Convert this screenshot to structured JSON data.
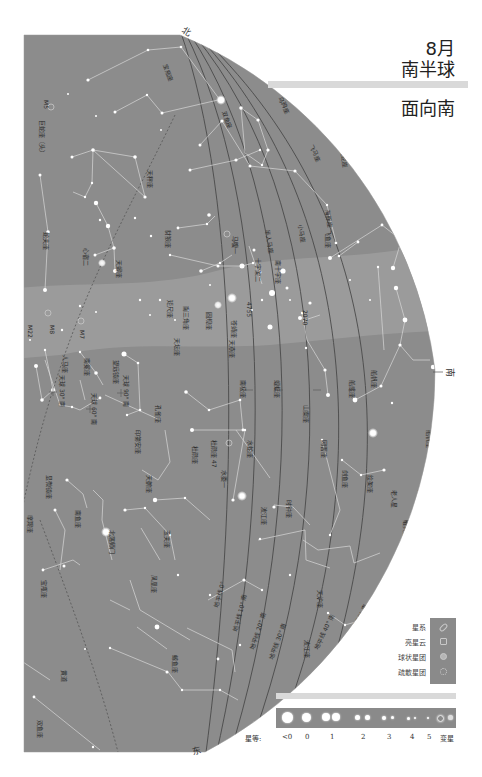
{
  "header": {
    "month": "8月",
    "hemisphere": "南半球",
    "facing": "面向南"
  },
  "directions": {
    "north": "北",
    "south": "南",
    "east": "东"
  },
  "horizon_lines": [
    {
      "label": "地平线 0°"
    },
    {
      "label": "地平线 10° 南"
    },
    {
      "label": "地平线 20° 南"
    },
    {
      "label": "地平线 30° 南"
    },
    {
      "label": "地平线 40° 南"
    },
    {
      "label": "地平线 50° 南"
    }
  ],
  "constellations": [
    "宝瓶座",
    "双鱼座",
    "飞马座",
    "小马座",
    "海豚座",
    "天鹰座",
    "盾牌座",
    "巨蛇座（头）",
    "蛇夫座",
    "天秤座",
    "天蝎座",
    "人马座",
    "南冕座",
    "望远镜座",
    "印第安座",
    "孔雀座",
    "天坛座",
    "南三角座",
    "圆规座",
    "矩尺座",
    "豺狼座",
    "半人马座",
    "南十字座",
    "苍蝇座",
    "天燕座",
    "蝘蜓座",
    "杜鹃座",
    "水蛇座",
    "山案座",
    "剑鱼座",
    "绘架座",
    "时钟座",
    "网罟座",
    "船底座",
    "船帆座",
    "飞鱼座",
    "天鹤座",
    "凤凰座",
    "玉夫座",
    "显微镜座",
    "摩羯座",
    "南鱼座",
    "波江座",
    "天炉座",
    "雕具座",
    "天鸽座",
    "乌鸦座",
    "巨爵座",
    "长蛇座"
  ],
  "deep_sky_labels": [
    "M5",
    "M8",
    "M7",
    "M22",
    "4755",
    "2070",
    "47",
    "南门二",
    "心宿二",
    "马腹一",
    "北落师门",
    "水委一",
    "老人星"
  ],
  "celestial_poles": [
    {
      "label": "天球 30° 南"
    },
    {
      "label": "天球 60° 南"
    },
    {
      "label": "天球 90° 南"
    }
  ],
  "legend": {
    "object_types": [
      {
        "label": "星系",
        "icon": "galaxy-icon"
      },
      {
        "label": "亮星云",
        "icon": "nebula-icon"
      },
      {
        "label": "球状星团",
        "icon": "globular-cluster-icon"
      },
      {
        "label": "疏散星团",
        "icon": "open-cluster-icon"
      }
    ],
    "magnitude_title": "星等:",
    "magnitudes": [
      "<0",
      "0",
      "1",
      "2",
      "3",
      "4",
      "5",
      "变星"
    ]
  },
  "colors": {
    "sky": "#8c8c8c",
    "milky_way": "#a2a2a2",
    "lines": "#d8d8d8",
    "horizon": "#444444",
    "legend_bar": "#8a8a8a",
    "title_bar": "#d9d9d9"
  }
}
